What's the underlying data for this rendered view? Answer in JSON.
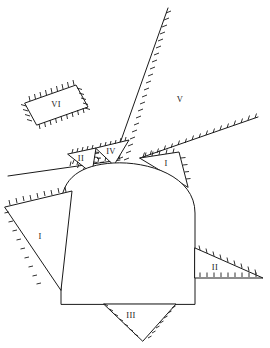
{
  "figure": {
    "background_color": "#ffffff",
    "line_color": "#1a1a1a",
    "width": 270,
    "height": 348
  },
  "labels": {
    "wedge_left": "I",
    "wedge_crown_right": "I",
    "wedge_crown_small": "II",
    "wedge_right": "II",
    "wedge_invert": "III",
    "wedge_crown_mid": "IV",
    "zone_upper": "V",
    "block_detached": "VI"
  },
  "geometry": {
    "tunnel": {
      "name": "arched-tunnel-opening",
      "left_wall_x": 61,
      "right_wall_x": 195,
      "floor_y": 304,
      "springline_y": 215,
      "crown_y": 170
    },
    "joint_lines": [
      {
        "name": "steep-joint",
        "from": [
          168,
          8
        ],
        "to": [
          113,
          163
        ]
      },
      {
        "name": "upper-right-joint",
        "from": [
          258,
          117
        ],
        "to": [
          140,
          158
        ]
      },
      {
        "name": "long-left-joint",
        "from": [
          8,
          176
        ],
        "to": [
          120,
          160
        ]
      }
    ],
    "wedges": [
      {
        "id": "I",
        "position": "left-sidewall",
        "points": [
          [
            5,
            207
          ],
          [
            70,
            192
          ],
          [
            67,
            290
          ]
        ]
      },
      {
        "id": "I",
        "position": "right-crown",
        "points": [
          [
            140,
            158
          ],
          [
            178,
            153
          ],
          [
            185,
            196
          ]
        ]
      },
      {
        "id": "II",
        "position": "crown-left-small",
        "points": [
          [
            70,
            152
          ],
          [
            96,
            148
          ],
          [
            91,
            172
          ]
        ]
      },
      {
        "id": "II",
        "position": "right-sidewall",
        "points": [
          [
            196,
            248
          ],
          [
            263,
            278
          ],
          [
            196,
            278
          ]
        ]
      },
      {
        "id": "III",
        "position": "invert",
        "points": [
          [
            104,
            304
          ],
          [
            176,
            304
          ],
          [
            143,
            341
          ]
        ]
      },
      {
        "id": "IV",
        "position": "crown-mid",
        "points": [
          [
            96,
            148
          ],
          [
            128,
            140
          ],
          [
            113,
            163
          ]
        ]
      }
    ]
  }
}
